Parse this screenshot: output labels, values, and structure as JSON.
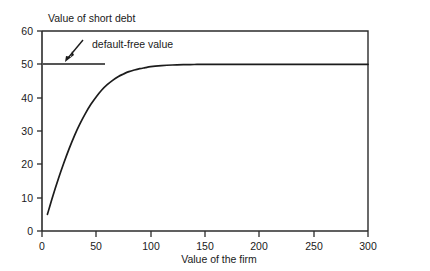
{
  "chart_data": {
    "type": "line",
    "title": "Value of short debt",
    "xlabel": "Value of the firm",
    "ylabel": "",
    "xlim": [
      0,
      300
    ],
    "ylim": [
      0,
      60
    ],
    "grid": false,
    "legend": "none",
    "x_ticks": [
      0,
      50,
      100,
      150,
      200,
      250,
      300
    ],
    "x_tick_labels": [
      "0",
      "50",
      "100",
      "150",
      "200",
      "250",
      "300"
    ],
    "y_ticks": [
      0,
      10,
      20,
      30,
      40,
      50,
      60
    ],
    "y_tick_labels": [
      "0",
      "10",
      "20",
      "30",
      "40",
      "50",
      "60"
    ],
    "series": [
      {
        "name": "value of short debt",
        "x": [
          5,
          10,
          15,
          20,
          25,
          30,
          35,
          40,
          45,
          50,
          55,
          60,
          65,
          70,
          75,
          80,
          85,
          90,
          95,
          100,
          110,
          120,
          130,
          140,
          150,
          175,
          200,
          225,
          250,
          275,
          300
        ],
        "values": [
          5.0,
          10.5,
          15.6,
          20.3,
          24.7,
          28.7,
          32.2,
          35.3,
          38.0,
          40.3,
          42.3,
          43.9,
          45.2,
          46.3,
          47.1,
          47.8,
          48.3,
          48.7,
          49.0,
          49.3,
          49.6,
          49.8,
          49.9,
          49.95,
          50.0,
          50.0,
          50.0,
          50.0,
          50.0,
          50.0,
          50.0
        ]
      },
      {
        "name": "default-free value",
        "x": [
          0,
          50
        ],
        "values": [
          50,
          50
        ]
      }
    ],
    "annotations": [
      {
        "label": "default-free value",
        "points_to_x": 22,
        "points_to_y": 50,
        "text_x": 46,
        "text_y": 56
      }
    ]
  },
  "axis": {
    "y_title": "Value of short debt",
    "x_title": "Value of the firm"
  },
  "annotation": {
    "text": "default-free value"
  }
}
